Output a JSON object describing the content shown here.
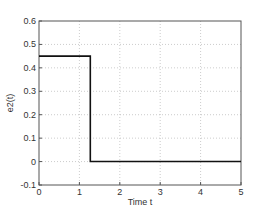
{
  "chart_data": {
    "type": "line",
    "title": "",
    "xlabel": "Time  t",
    "ylabel": "e2(t)",
    "xlim": [
      0,
      5
    ],
    "ylim": [
      -0.1,
      0.6
    ],
    "xticks": [
      "0",
      "1",
      "2",
      "3",
      "4",
      "5"
    ],
    "yticks": [
      "-0.1",
      "0",
      "0.1",
      "0.2",
      "0.3",
      "0.4",
      "0.5",
      "0.6"
    ],
    "grid": true,
    "series": [
      {
        "name": "e2(t)",
        "x": [
          0,
          1.27,
          1.27,
          5
        ],
        "y": [
          0.45,
          0.45,
          0,
          0
        ],
        "color": "#000000"
      }
    ]
  }
}
